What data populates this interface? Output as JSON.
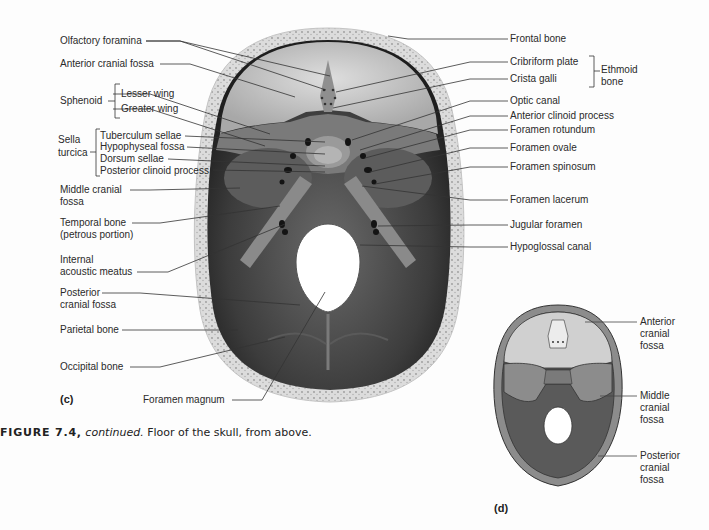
{
  "figure": {
    "number_label": "FIGURE 7.4,",
    "continued": "continued.",
    "caption": "Floor of the skull, from above."
  },
  "panel_c": {
    "label": "(c)",
    "left_labels": {
      "olfactory_foramina": "Olfactory foramina",
      "anterior_cranial_fossa": "Anterior cranial fossa",
      "sphenoid": "Sphenoid",
      "lesser_wing": "Lesser wing",
      "greater_wing": "Greater wing",
      "sella_turcica_1": "Sella",
      "sella_turcica_2": "turcica",
      "tuberculum_sellae": "Tuberculum sellae",
      "hypophyseal_fossa": "Hypophyseal fossa",
      "dorsum_sellae": "Dorsum sellae",
      "posterior_clinoid_process": "Posterior clinoid process",
      "middle_cranial_fossa_1": "Middle cranial",
      "middle_cranial_fossa_2": "fossa",
      "temporal_bone_1": "Temporal bone",
      "temporal_bone_2": "(petrous portion)",
      "internal_acoustic_meatus_1": "Internal",
      "internal_acoustic_meatus_2": "acoustic meatus",
      "posterior_cranial_fossa_1": "Posterior",
      "posterior_cranial_fossa_2": "cranial fossa",
      "parietal_bone": "Parietal bone",
      "occipital_bone": "Occipital bone",
      "foramen_magnum": "Foramen magnum"
    },
    "right_labels": {
      "frontal_bone": "Frontal bone",
      "cribriform_plate": "Cribriform plate",
      "crista_galli": "Crista galli",
      "ethmoid_bone_1": "Ethmoid",
      "ethmoid_bone_2": "bone",
      "optic_canal": "Optic canal",
      "anterior_clinoid_process": "Anterior clinoid process",
      "foramen_rotundum": "Foramen rotundum",
      "foramen_ovale": "Foramen ovale",
      "foramen_spinosum": "Foramen spinosum",
      "foramen_lacerum": "Foramen lacerum",
      "jugular_foramen": "Jugular foramen",
      "hypoglossal_canal": "Hypoglossal canal"
    }
  },
  "panel_d": {
    "label": "(d)",
    "labels": {
      "anterior_1": "Anterior",
      "anterior_2": "cranial",
      "anterior_3": "fossa",
      "middle_1": "Middle",
      "middle_2": "cranial",
      "middle_3": "fossa",
      "posterior_1": "Posterior",
      "posterior_2": "cranial",
      "posterior_3": "fossa"
    }
  },
  "colors": {
    "bone_rim": "#d9d9d9",
    "anterior_fossa": "#bdbdbd",
    "middle_fossa": "#6e6e6e",
    "posterior_fossa": "#3a3a3a",
    "diagram_anterior": "#cfcfcf",
    "diagram_middle": "#8c8c8c",
    "diagram_posterior": "#5a5a5a",
    "leader_line": "#333333"
  }
}
